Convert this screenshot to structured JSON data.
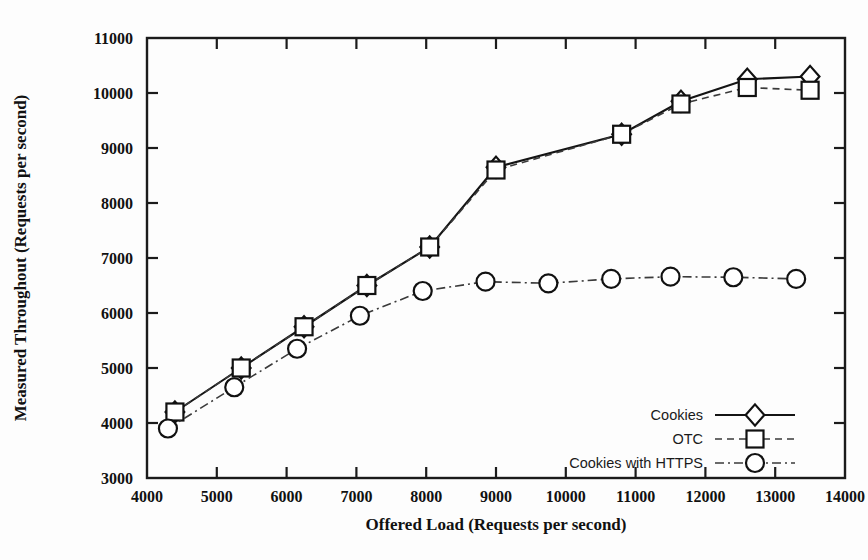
{
  "chart_data": {
    "type": "line",
    "title": "",
    "xlabel": "Offered Load (Requests per second)",
    "ylabel": "Measured Throughout (Requests per second)",
    "xlim": [
      4000,
      14000
    ],
    "ylim": [
      3000,
      11000
    ],
    "xticks": [
      4000,
      5000,
      6000,
      7000,
      8000,
      9000,
      10000,
      11000,
      12000,
      13000,
      14000
    ],
    "yticks": [
      3000,
      4000,
      5000,
      6000,
      7000,
      8000,
      9000,
      10000,
      11000
    ],
    "grid": false,
    "legend_position": "bottom-right",
    "x": [
      4400,
      5350,
      6250,
      7150,
      8050,
      9000,
      10800,
      11650,
      12600,
      13500
    ],
    "series": [
      {
        "name": "Cookies",
        "marker": "diamond",
        "line": "solid",
        "x": [
          4400,
          5350,
          6250,
          7150,
          8050,
          9000,
          10800,
          11650,
          12600,
          13500
        ],
        "values": [
          4200,
          5000,
          5750,
          6500,
          7200,
          8650,
          9250,
          9850,
          10250,
          10300
        ]
      },
      {
        "name": "OTC",
        "marker": "square",
        "line": "dashed",
        "x": [
          4400,
          5350,
          6250,
          7150,
          8050,
          9000,
          10800,
          11650,
          12600,
          13500
        ],
        "values": [
          4200,
          5000,
          5750,
          6500,
          7200,
          8600,
          9250,
          9800,
          10100,
          10050
        ]
      },
      {
        "name": "Cookies with HTTPS",
        "marker": "circle",
        "line": "dashdot",
        "x": [
          4300,
          5250,
          6150,
          7050,
          7950,
          8850,
          9750,
          10650,
          11500,
          12400,
          13300
        ],
        "values": [
          3900,
          4650,
          5350,
          5950,
          6400,
          6570,
          6540,
          6620,
          6660,
          6650,
          6620
        ]
      }
    ],
    "legend": [
      {
        "label": "Cookies",
        "marker": "diamond",
        "line": "solid"
      },
      {
        "label": "OTC",
        "marker": "square",
        "line": "dashed"
      },
      {
        "label": "Cookies with HTTPS",
        "marker": "circle",
        "line": "dashdot"
      }
    ]
  }
}
